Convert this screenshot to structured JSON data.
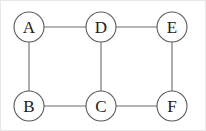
{
  "figure": {
    "kind": "undirected-graph-diagram",
    "title": "",
    "background_color": "#ffffff",
    "border_color": "#e8e8e8",
    "width": 206,
    "height": 131
  },
  "style": {
    "node_fill": "#ffffff",
    "node_stroke": "#5a5a5a",
    "node_stroke_width": 1.1,
    "node_radius": 15,
    "edge_stroke": "#6b6b6b",
    "edge_stroke_width": 1.1,
    "label_color": "#1a1a1a",
    "label_font_size": 17
  },
  "nodes": [
    {
      "id": "A",
      "label": "A",
      "cx": 28,
      "cy": 26,
      "r": 15
    },
    {
      "id": "D",
      "label": "D",
      "cx": 100,
      "cy": 26,
      "r": 15
    },
    {
      "id": "E",
      "label": "E",
      "cx": 171,
      "cy": 26,
      "r": 15
    },
    {
      "id": "B",
      "label": "B",
      "cx": 28,
      "cy": 105,
      "r": 15
    },
    {
      "id": "C",
      "label": "C",
      "cx": 100,
      "cy": 105,
      "r": 15
    },
    {
      "id": "F",
      "label": "F",
      "cx": 171,
      "cy": 105,
      "r": 15
    }
  ],
  "edges": [
    {
      "id": "A-D",
      "source": "A",
      "target": "D",
      "x1": 43,
      "y1": 26,
      "x2": 85,
      "y2": 26
    },
    {
      "id": "D-E",
      "source": "D",
      "target": "E",
      "x1": 115,
      "y1": 26,
      "x2": 156,
      "y2": 26
    },
    {
      "id": "A-B",
      "source": "A",
      "target": "B",
      "x1": 28,
      "y1": 41,
      "x2": 28,
      "y2": 90
    },
    {
      "id": "D-C",
      "source": "D",
      "target": "C",
      "x1": 100,
      "y1": 41,
      "x2": 100,
      "y2": 90
    },
    {
      "id": "E-F",
      "source": "E",
      "target": "F",
      "x1": 171,
      "y1": 41,
      "x2": 171,
      "y2": 90
    },
    {
      "id": "B-C",
      "source": "B",
      "target": "C",
      "x1": 43,
      "y1": 105,
      "x2": 85,
      "y2": 105
    },
    {
      "id": "C-F",
      "source": "C",
      "target": "F",
      "x1": 115,
      "y1": 105,
      "x2": 156,
      "y2": 105
    }
  ]
}
